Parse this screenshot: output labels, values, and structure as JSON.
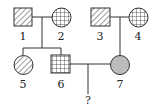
{
  "pedigree": {
    "individuals": [
      {
        "id": "1",
        "label": "1",
        "sex": "male",
        "pattern": "diagonal-hatch"
      },
      {
        "id": "2",
        "label": "2",
        "sex": "female",
        "pattern": "grid"
      },
      {
        "id": "3",
        "label": "3",
        "sex": "male",
        "pattern": "diagonal-hatch"
      },
      {
        "id": "4",
        "label": "4",
        "sex": "female",
        "pattern": "grid"
      },
      {
        "id": "5",
        "label": "5",
        "sex": "female",
        "pattern": "diagonal-hatch"
      },
      {
        "id": "6",
        "label": "6",
        "sex": "male",
        "pattern": "grid"
      },
      {
        "id": "7",
        "label": "7",
        "sex": "female",
        "pattern": "solid-grey"
      }
    ],
    "unknown_child_label": "?",
    "colors": {
      "line": "#333333",
      "grey_fill": "#bcbcbc",
      "background": "#ffffff"
    }
  }
}
